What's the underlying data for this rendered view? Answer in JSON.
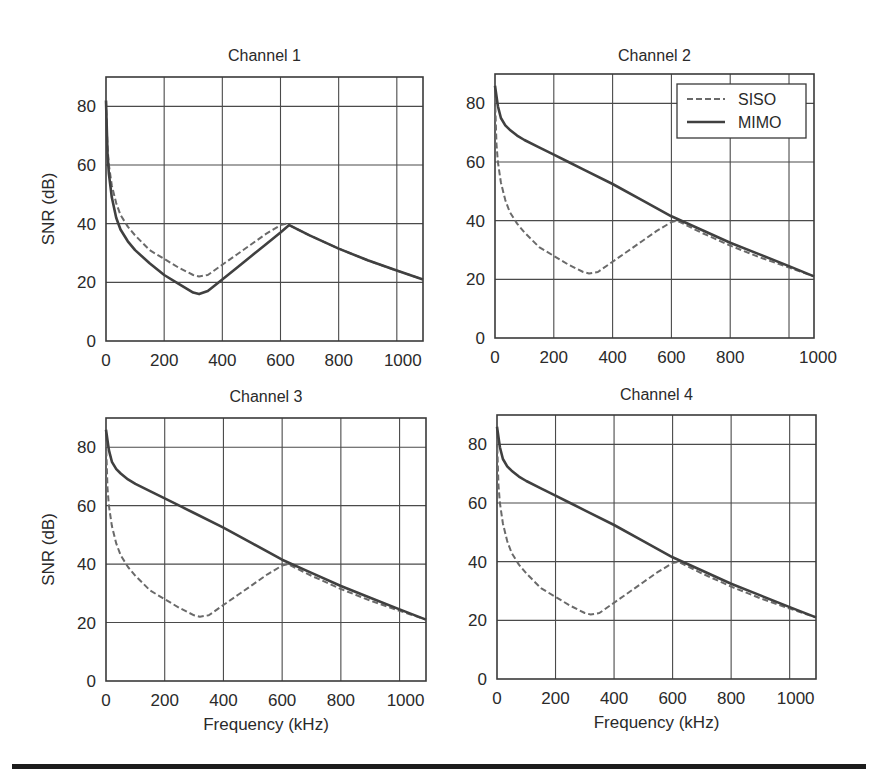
{
  "figure": {
    "legend": {
      "siso_label": "SISO",
      "mimo_label": "MIMO"
    },
    "colors": {
      "axis": "#3a3a3a",
      "grid": "#4a4a4a",
      "mimo": "#404040",
      "siso": "#6a6a6a",
      "text": "#2a2a2a"
    }
  },
  "chart_data": [
    {
      "type": "line",
      "title": "Channel 1",
      "xlabel": "",
      "ylabel": "SNR (dB)",
      "xlim": [
        0,
        1090
      ],
      "ylim": [
        0,
        90
      ],
      "xticks": [
        0,
        200,
        400,
        600,
        800,
        1000
      ],
      "yticks": [
        0,
        20,
        40,
        60,
        80
      ],
      "grid": true,
      "legend": false,
      "series": [
        {
          "name": "SISO",
          "style": "dashed",
          "x": [
            0,
            5,
            10,
            20,
            35,
            50,
            75,
            100,
            150,
            200,
            250,
            300,
            320,
            350,
            400,
            450,
            500,
            550,
            600,
            620,
            700,
            800,
            900,
            1000,
            1090
          ],
          "y": [
            82,
            66,
            60,
            53,
            47,
            43,
            39,
            36,
            31,
            28,
            25,
            22.5,
            22,
            22.5,
            26,
            29.5,
            33,
            36.5,
            39.5,
            40,
            36,
            31.5,
            27.5,
            24,
            21
          ]
        },
        {
          "name": "MIMO",
          "style": "solid",
          "x": [
            0,
            5,
            10,
            20,
            35,
            50,
            75,
            100,
            150,
            200,
            250,
            300,
            320,
            350,
            400,
            450,
            500,
            550,
            600,
            630,
            700,
            800,
            900,
            1000,
            1090
          ],
          "y": [
            82,
            64,
            57,
            49,
            42,
            38,
            34,
            31,
            26.5,
            22.5,
            19.5,
            16.5,
            16,
            17,
            21,
            25,
            29,
            33,
            37,
            39.5,
            36,
            31.5,
            27.5,
            24,
            21
          ]
        }
      ]
    },
    {
      "type": "line",
      "title": "Channel 2",
      "xlabel": "",
      "ylabel": "",
      "xlim": [
        0,
        1085
      ],
      "ylim": [
        0,
        90
      ],
      "xticks": [
        0,
        200,
        400,
        600,
        800,
        1000
      ],
      "yticks": [
        0,
        20,
        40,
        60,
        80
      ],
      "grid": true,
      "legend": true,
      "legend_position": "upper right",
      "series": [
        {
          "name": "SISO",
          "style": "dashed",
          "x": [
            0,
            5,
            10,
            20,
            35,
            50,
            75,
            100,
            150,
            200,
            250,
            300,
            320,
            350,
            400,
            450,
            500,
            550,
            600,
            620,
            700,
            800,
            900,
            1000,
            1085
          ],
          "y": [
            82,
            66,
            60,
            53,
            47,
            43,
            39,
            36,
            31,
            28,
            25,
            22.5,
            22,
            22.5,
            26,
            29.5,
            33,
            36.5,
            39.5,
            40,
            36,
            31.5,
            27.5,
            24,
            21
          ]
        },
        {
          "name": "MIMO",
          "style": "solid",
          "x": [
            0,
            10,
            20,
            35,
            50,
            75,
            100,
            150,
            200,
            250,
            300,
            400,
            500,
            600,
            700,
            800,
            900,
            1000,
            1085
          ],
          "y": [
            86,
            79,
            75,
            72.5,
            71,
            69,
            67.5,
            65,
            62.5,
            60,
            57.5,
            52.5,
            47,
            41.5,
            37,
            32.5,
            28.5,
            24.5,
            21
          ]
        }
      ]
    },
    {
      "type": "line",
      "title": "Channel 3",
      "xlabel": "Frequency (kHz)",
      "ylabel": "SNR (dB)",
      "xlim": [
        0,
        1090
      ],
      "ylim": [
        0,
        90
      ],
      "xticks": [
        0,
        200,
        400,
        600,
        800,
        1000
      ],
      "yticks": [
        0,
        20,
        40,
        60,
        80
      ],
      "grid": true,
      "legend": false,
      "series": [
        {
          "name": "SISO",
          "style": "dashed",
          "x": [
            0,
            5,
            10,
            20,
            35,
            50,
            75,
            100,
            150,
            200,
            250,
            300,
            320,
            350,
            400,
            450,
            500,
            550,
            600,
            620,
            700,
            800,
            900,
            1000,
            1090
          ],
          "y": [
            82,
            66,
            60,
            53,
            47,
            43,
            39,
            36,
            31,
            28,
            25,
            22.5,
            22,
            22.5,
            26,
            29.5,
            33,
            36.5,
            39.5,
            40,
            36,
            31.5,
            27.5,
            24,
            21
          ]
        },
        {
          "name": "MIMO",
          "style": "solid",
          "x": [
            0,
            10,
            20,
            35,
            50,
            75,
            100,
            150,
            200,
            250,
            300,
            400,
            500,
            600,
            700,
            800,
            900,
            1000,
            1090
          ],
          "y": [
            86,
            79,
            75,
            72.5,
            71,
            69,
            67.5,
            65,
            62.5,
            60,
            57.5,
            52.5,
            47,
            41.5,
            37,
            32.5,
            28.5,
            24.5,
            21
          ]
        }
      ]
    },
    {
      "type": "line",
      "title": "Channel 4",
      "xlabel": "Frequency (kHz)",
      "ylabel": "",
      "xlim": [
        0,
        1090
      ],
      "ylim": [
        0,
        90
      ],
      "xticks": [
        0,
        200,
        400,
        600,
        800,
        1000
      ],
      "yticks": [
        0,
        20,
        40,
        60,
        80
      ],
      "grid": true,
      "legend": false,
      "series": [
        {
          "name": "SISO",
          "style": "dashed",
          "x": [
            0,
            5,
            10,
            20,
            35,
            50,
            75,
            100,
            150,
            200,
            250,
            300,
            320,
            350,
            400,
            450,
            500,
            550,
            600,
            620,
            700,
            800,
            900,
            1000,
            1090
          ],
          "y": [
            82,
            66,
            60,
            53,
            47,
            43,
            39,
            36,
            31,
            28,
            25,
            22.5,
            22,
            22.5,
            26,
            29.5,
            33,
            36.5,
            39.5,
            40,
            36,
            31.5,
            27.5,
            24,
            21
          ]
        },
        {
          "name": "MIMO",
          "style": "solid",
          "x": [
            0,
            10,
            20,
            35,
            50,
            75,
            100,
            150,
            200,
            250,
            300,
            400,
            500,
            600,
            700,
            800,
            900,
            1000,
            1090
          ],
          "y": [
            86,
            79,
            75,
            72.5,
            71,
            69,
            67.5,
            65,
            62.5,
            60,
            57.5,
            52.5,
            47,
            41.5,
            37,
            32.5,
            28.5,
            24.5,
            21
          ]
        }
      ]
    }
  ]
}
